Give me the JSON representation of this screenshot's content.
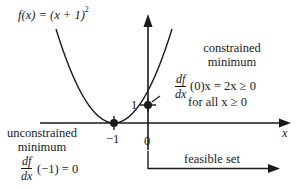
{
  "figure": {
    "function_label": "f(x) = (x + 1)",
    "function_exponent": "2",
    "x_axis_label": "x",
    "tick_labels": {
      "x_neg1": "−1",
      "x_0": "0",
      "y_1": "1"
    },
    "constrained": {
      "title_line1": "constrained",
      "title_line2": "minimum",
      "deriv_num": "df",
      "deriv_den": "dx",
      "deriv_rest": "(0)x = 2x ≥ 0",
      "condition": "for all x ≥ 0"
    },
    "unconstrained": {
      "title_line1": "unconstrained",
      "title_line2": "minimum",
      "deriv_num": "df",
      "deriv_den": "dx",
      "deriv_rest": "(−1) = 0"
    },
    "feasible_set_label": "feasible set",
    "colors": {
      "ink": "#1a1a1a",
      "background": "#ffffff"
    }
  },
  "points": [
    {
      "name": "unconstrained-minimum",
      "x": -1,
      "y": 0
    },
    {
      "name": "constrained-minimum",
      "x": 0,
      "y": 1
    }
  ]
}
